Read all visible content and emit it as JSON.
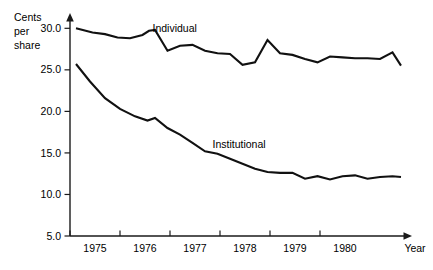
{
  "chart_data": {
    "type": "line",
    "title": "",
    "ylabel": "Cents per share",
    "ylabel_lines": [
      "Cents",
      "per",
      "share"
    ],
    "xlabel": "Year",
    "ylim": [
      5.0,
      31.0
    ],
    "xlim": [
      1974.5,
      1981.2
    ],
    "grid": false,
    "legend": "inline-labels",
    "ytick_labels": [
      "5.0",
      "10.0",
      "15.0",
      "20.0",
      "25.0",
      "30.0"
    ],
    "ytick_values": [
      5.0,
      10.0,
      15.0,
      20.0,
      25.0,
      30.0
    ],
    "xtick_labels": [
      "1975",
      "1976",
      "1977",
      "1978",
      "1979",
      "1980"
    ],
    "xtick_values": [
      1975,
      1976,
      1977,
      1978,
      1979,
      1980
    ],
    "series": [
      {
        "name": "Individual",
        "label_x": 1976.15,
        "label_y": 29.6,
        "x": [
          1974.62,
          1974.95,
          1975.2,
          1975.45,
          1975.7,
          1975.95,
          1976.08,
          1976.2,
          1976.45,
          1976.7,
          1976.95,
          1977.2,
          1977.45,
          1977.7,
          1977.95,
          1978.2,
          1978.45,
          1978.7,
          1978.95,
          1979.2,
          1979.45,
          1979.7,
          1979.95,
          1980.2,
          1980.45,
          1980.7,
          1980.95,
          1981.12
        ],
        "y": [
          30.0,
          29.5,
          29.3,
          28.9,
          28.8,
          29.2,
          29.7,
          29.8,
          27.3,
          27.9,
          28.0,
          27.3,
          27.0,
          26.9,
          25.6,
          25.9,
          28.6,
          27.0,
          26.8,
          26.3,
          25.9,
          26.6,
          26.5,
          26.4,
          26.4,
          26.3,
          27.1,
          25.5
        ]
      },
      {
        "name": "Institutional",
        "label_x": 1977.35,
        "label_y": 15.6,
        "x": [
          1974.62,
          1974.9,
          1975.2,
          1975.5,
          1975.8,
          1976.05,
          1976.2,
          1976.45,
          1976.7,
          1976.95,
          1977.2,
          1977.45,
          1977.7,
          1977.95,
          1978.2,
          1978.45,
          1978.7,
          1978.95,
          1979.2,
          1979.45,
          1979.7,
          1979.95,
          1980.2,
          1980.45,
          1980.7,
          1980.95,
          1981.12
        ],
        "y": [
          25.7,
          23.6,
          21.6,
          20.3,
          19.4,
          18.9,
          19.2,
          18.0,
          17.2,
          16.2,
          15.2,
          14.9,
          14.3,
          13.7,
          13.1,
          12.7,
          12.6,
          12.6,
          11.9,
          12.2,
          11.8,
          12.2,
          12.3,
          11.9,
          12.1,
          12.2,
          12.1
        ]
      }
    ]
  },
  "axis": {
    "y_title_line1": "Cents",
    "y_title_line2": "per",
    "y_title_line3": "share",
    "x_title": "Year"
  }
}
